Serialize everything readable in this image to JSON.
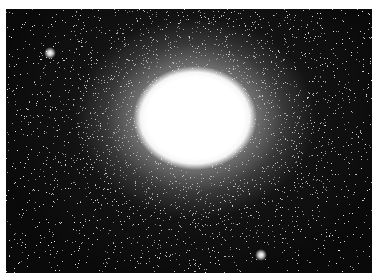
{
  "image": {
    "subject": "globular star cluster",
    "description": "Dense spherical star cluster with a saturated bright white core against a black star field",
    "colors": {
      "background": "#0a0a0a",
      "core": "#ffffff",
      "border": "#ffffff"
    },
    "core_center": [
      195,
      118
    ],
    "bright_stars": [
      {
        "x": 261,
        "y": 255
      },
      {
        "x": 50,
        "y": 53
      }
    ]
  }
}
